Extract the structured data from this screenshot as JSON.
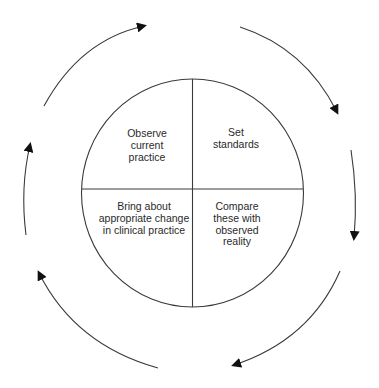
{
  "diagram": {
    "type": "cycle",
    "colors": {
      "line": "#3a3a3a",
      "arrow": "#111111",
      "text": "#2a2a2a",
      "background": "#ffffff"
    },
    "quadrants": {
      "top_left": {
        "lines": [
          "Observe",
          "current",
          "practice"
        ]
      },
      "top_right": {
        "lines": [
          "Set",
          "standards"
        ]
      },
      "bottom_right": {
        "lines": [
          "Compare",
          "these with",
          "observed",
          "reality"
        ]
      },
      "bottom_left": {
        "lines": [
          "Bring about",
          "appropriate change",
          "in clinical practice"
        ]
      }
    },
    "cycle_direction": "clockwise",
    "arrow_count": 6
  }
}
